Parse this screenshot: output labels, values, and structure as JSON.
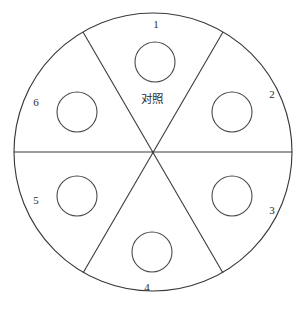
{
  "figure": {
    "type": "sector-plot-diagram",
    "shape": "circle",
    "background_color": "#ffffff",
    "line_color": "#3a3a3a",
    "text_color": "#2b2b2b"
  },
  "outer_circle": {
    "center_x": 153,
    "center_y": 152,
    "radius": 139
  },
  "center_label": {
    "text": "对照",
    "x": 152,
    "y": 99
  },
  "dividers": [
    {
      "name": "horizontal-divider",
      "angle_deg": 0,
      "x1": 14,
      "y1": 152,
      "x2": 292,
      "y2": 152
    },
    {
      "name": "diagonal-divider-a",
      "angle_deg": 60,
      "x1": 83,
      "y1": 32,
      "x2": 223,
      "y2": 273
    },
    {
      "name": "diagonal-divider-b",
      "angle_deg": 120,
      "x1": 223,
      "y1": 32,
      "x2": 83,
      "y2": 273
    }
  ],
  "sectors": [
    {
      "id": 1,
      "label": "1",
      "label_x": 156,
      "label_y": 25,
      "circle_cx": 155,
      "circle_cy": 62,
      "circle_r": 20
    },
    {
      "id": 2,
      "label": "2",
      "label_x": 272,
      "label_y": 95,
      "circle_cx": 232,
      "circle_cy": 112,
      "circle_r": 20
    },
    {
      "id": 3,
      "label": "3",
      "label_x": 272,
      "label_y": 211,
      "circle_cx": 232,
      "circle_cy": 196,
      "circle_r": 20
    },
    {
      "id": 4,
      "label": "4",
      "label_x": 147,
      "label_y": 288,
      "circle_cx": 152,
      "circle_cy": 252,
      "circle_r": 20
    },
    {
      "id": 5,
      "label": "5",
      "label_x": 36,
      "label_y": 201,
      "circle_cx": 77,
      "circle_cy": 196,
      "circle_r": 20
    },
    {
      "id": 6,
      "label": "6",
      "label_x": 36,
      "label_y": 103,
      "circle_cx": 77,
      "circle_cy": 112,
      "circle_r": 20
    }
  ]
}
